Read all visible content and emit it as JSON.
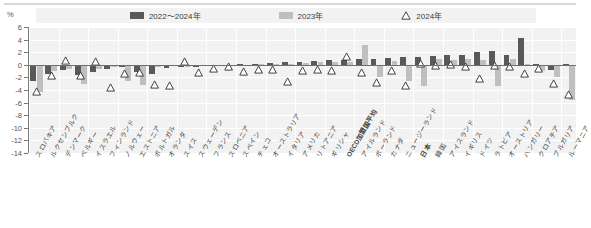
{
  "axis": {
    "unit_label": "%",
    "y_ticks": [
      6,
      4,
      2,
      0,
      -2,
      -4,
      -6,
      -8,
      -10,
      -12,
      -14
    ],
    "ylim": [
      -14,
      6
    ]
  },
  "legend": {
    "items": [
      {
        "label": "2022〜2024年",
        "icon": "dark-bar-swatch",
        "color": "#595959"
      },
      {
        "label": "2023年",
        "icon": "light-bar-swatch",
        "color": "#bfbfbf"
      },
      {
        "label": "2024年",
        "icon": "triangle-marker",
        "color": "#ffffff"
      }
    ]
  },
  "chart_data": {
    "type": "bar",
    "title": "",
    "xlabel": "",
    "ylabel": "%",
    "ylim": [
      -14,
      6
    ],
    "grid": true,
    "legend_position": "top",
    "categories": [
      "スロバキア",
      "ルクセンブルク",
      "デンマーク",
      "ベルギー",
      "イスラエル",
      "フィンランド",
      "ノルウェー",
      "エストニア",
      "ポルトガル",
      "オランダ",
      "スイス",
      "スウェーデン",
      "フランス",
      "スロベニア",
      "スペイン",
      "チェコ",
      "オーストラリア",
      "イタリア",
      "アメリカ",
      "リトアニア",
      "ギリシャ",
      "OECD加盟国平均",
      "アイルランド",
      "ポーランド",
      "カナダ",
      "ニュージーランド",
      "日本",
      "韓国",
      "アイスランド",
      "イギリス",
      "ドイツ",
      "ラトビア",
      "オーストリア",
      "ハンガリー",
      "クロアチア",
      "ブルガリア",
      "ルーマニア"
    ],
    "series": [
      {
        "name": "2022〜2024年",
        "color": "#595959",
        "values": [
          -2.6,
          -1.4,
          -0.9,
          -1.6,
          -1.2,
          -0.6,
          -0.3,
          -1.1,
          -1.5,
          -0.5,
          -0.3,
          -0.4,
          -0.2,
          -0.1,
          0.1,
          0.2,
          0.3,
          0.4,
          0.5,
          0.6,
          0.7,
          0.8,
          0.9,
          1.0,
          1.1,
          1.2,
          1.3,
          1.4,
          1.5,
          1.6,
          2.0,
          2.2,
          1.6,
          4.3,
          0.2,
          -0.8,
          0.1
        ]
      },
      {
        "name": "2023年",
        "color": "#bfbfbf",
        "values": [
          -4.3,
          -1.0,
          -0.6,
          -3.0,
          -0.6,
          -0.3,
          -2.6,
          -3.2,
          -0.4,
          -0.2,
          -0.3,
          -0.2,
          -0.2,
          -0.1,
          0.0,
          0.1,
          0.2,
          0.2,
          0.3,
          0.4,
          0.4,
          0.5,
          3.2,
          -1.9,
          0.6,
          -2.6,
          -3.4,
          0.9,
          0.8,
          0.9,
          0.7,
          -3.3,
          1.0,
          0.1,
          -1.0,
          -1.9,
          -5.6
        ]
      },
      {
        "name": "2024年",
        "marker": "triangle",
        "values": [
          -3.5,
          -0.9,
          1.4,
          -1.0,
          1.3,
          -2.8,
          -0.6,
          -0.4,
          -2.4,
          -2.6,
          1.3,
          -0.5,
          0.2,
          0.4,
          -0.3,
          0.0,
          0.0,
          -1.9,
          -0.1,
          0.0,
          -0.1,
          2.1,
          -0.5,
          -2.1,
          -0.1,
          -2.5,
          0.9,
          0.7,
          0.8,
          0.5,
          -1.5,
          0.6,
          0.4,
          -0.6,
          0.1,
          -2.2,
          -4.0
        ]
      }
    ]
  }
}
